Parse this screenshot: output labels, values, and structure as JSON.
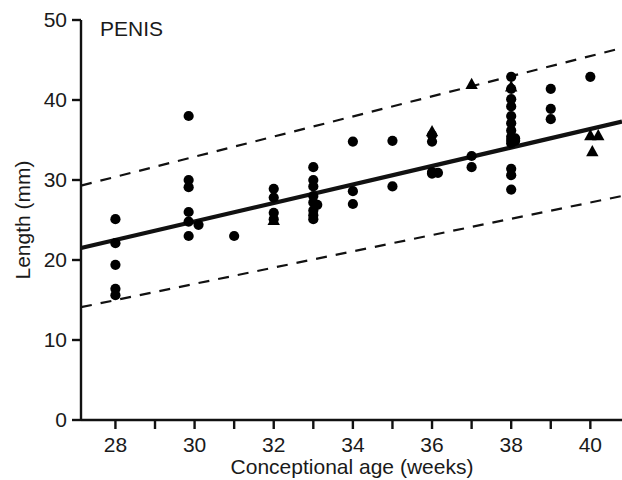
{
  "chart_data": {
    "type": "scatter",
    "title": "PENIS",
    "xlabel": "Conceptional age (weeks)",
    "ylabel": "Length (mm)",
    "xlim": [
      27.13,
      40.8
    ],
    "ylim": [
      0,
      50
    ],
    "xticks": [
      28,
      29,
      30,
      31,
      32,
      33,
      34,
      35,
      36,
      37,
      38,
      39,
      40
    ],
    "xtick_labels": [
      "28",
      "",
      "30",
      "",
      "32",
      "",
      "34",
      "",
      "36",
      "",
      "38",
      "",
      "40"
    ],
    "yticks": [
      0,
      10,
      20,
      30,
      40,
      50
    ],
    "ytick_labels": [
      "0",
      "10",
      "20",
      "30",
      "40",
      "50"
    ],
    "grid": false,
    "legend": null,
    "series": [
      {
        "name": "circles",
        "marker": "circle",
        "points": [
          [
            28,
            25.1
          ],
          [
            28,
            22.1
          ],
          [
            28,
            19.4
          ],
          [
            28,
            16.4
          ],
          [
            28,
            15.6
          ],
          [
            29.85,
            38.0
          ],
          [
            29.85,
            30.0
          ],
          [
            29.85,
            29.1
          ],
          [
            29.85,
            26.0
          ],
          [
            29.85,
            24.8
          ],
          [
            29.85,
            23.0
          ],
          [
            30.1,
            24.4
          ],
          [
            31,
            23.0
          ],
          [
            32,
            28.9
          ],
          [
            32,
            27.8
          ],
          [
            32,
            25.9
          ],
          [
            32,
            25.1
          ],
          [
            33,
            31.6
          ],
          [
            33,
            30.0
          ],
          [
            33,
            29.2
          ],
          [
            33,
            28.0
          ],
          [
            33,
            27.2
          ],
          [
            33,
            26.2
          ],
          [
            33,
            25.6
          ],
          [
            33,
            25.1
          ],
          [
            33.1,
            26.9
          ],
          [
            34,
            34.8
          ],
          [
            34,
            28.6
          ],
          [
            34,
            27.0
          ],
          [
            35,
            34.9
          ],
          [
            35,
            29.2
          ],
          [
            36,
            35.6
          ],
          [
            36,
            34.8
          ],
          [
            36,
            31.0
          ],
          [
            36,
            30.8
          ],
          [
            36.15,
            30.9
          ],
          [
            37,
            33.0
          ],
          [
            37,
            31.6
          ],
          [
            38,
            42.9
          ],
          [
            38,
            41.4
          ],
          [
            38,
            40.1
          ],
          [
            38,
            39.2
          ],
          [
            38,
            38.0
          ],
          [
            38,
            37.1
          ],
          [
            38,
            36.2
          ],
          [
            38,
            35.4
          ],
          [
            38,
            35.0
          ],
          [
            38,
            34.6
          ],
          [
            38,
            31.4
          ],
          [
            38,
            30.6
          ],
          [
            38,
            28.8
          ],
          [
            38.1,
            35.2
          ],
          [
            38.1,
            34.9
          ],
          [
            39,
            41.4
          ],
          [
            39,
            38.9
          ],
          [
            39,
            37.6
          ],
          [
            40,
            42.9
          ]
        ]
      },
      {
        "name": "triangles",
        "marker": "triangle",
        "points": [
          [
            32,
            25.0
          ],
          [
            36,
            36.1
          ],
          [
            37,
            42.0
          ],
          [
            38,
            41.7
          ],
          [
            40,
            35.6
          ],
          [
            40.2,
            35.6
          ],
          [
            40.05,
            33.6
          ]
        ]
      }
    ],
    "fit_line": {
      "style": "solid",
      "label": "regression",
      "x": [
        27.13,
        40.8
      ],
      "y": [
        21.5,
        37.3
      ]
    },
    "confidence_bands": [
      {
        "style": "dashed",
        "label": "upper",
        "x": [
          27.13,
          40.8
        ],
        "y": [
          29.3,
          46.5
        ]
      },
      {
        "style": "dashed",
        "label": "lower",
        "x": [
          27.13,
          40.8
        ],
        "y": [
          14.1,
          28.0
        ]
      }
    ]
  },
  "axes": {
    "y_axis_title": "Length (mm)",
    "x_axis_title": "Conceptional age (weeks)"
  },
  "colors": {
    "ink": "#111111",
    "background": "#ffffff",
    "marker": "#000000"
  }
}
